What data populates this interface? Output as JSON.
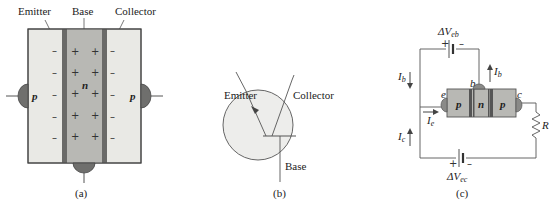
{
  "figure_a": {
    "labels": {
      "emitter": "Emitter",
      "base": "Base",
      "collector": "Collector"
    },
    "regions": {
      "left": "p",
      "middle": "n",
      "right": "p"
    },
    "left_charge": "–",
    "base_charge": "+",
    "right_charge": "–",
    "caption": "(a)"
  },
  "figure_b": {
    "labels": {
      "emitter": "Emitter",
      "collector": "Collector",
      "base": "Base"
    },
    "caption": "(b)"
  },
  "figure_c": {
    "regions": {
      "left": "p",
      "middle": "n",
      "right": "p"
    },
    "terminals": {
      "emitter": "e",
      "base": "b",
      "collector": "c"
    },
    "battery_top": {
      "label_main": "ΔV",
      "label_sub": "eb",
      "plus": "+",
      "minus": "–"
    },
    "battery_bottom": {
      "label_main": "ΔV",
      "label_sub": "ec",
      "plus": "+",
      "minus": "–"
    },
    "currents": {
      "ib_left": {
        "main": "I",
        "sub": "b"
      },
      "ib_right": {
        "main": "I",
        "sub": "b"
      },
      "ie": {
        "main": "I",
        "sub": "e"
      },
      "ic": {
        "main": "I",
        "sub": "c"
      }
    },
    "resistor": "R",
    "caption": "(c)"
  },
  "colors": {
    "p_region": "#e9e9e5",
    "n_region": "#b8b8b4",
    "junction": "#6a6a68",
    "contact": "#7a7a78",
    "line": "#555555",
    "circle_fill": "#ededeb"
  }
}
